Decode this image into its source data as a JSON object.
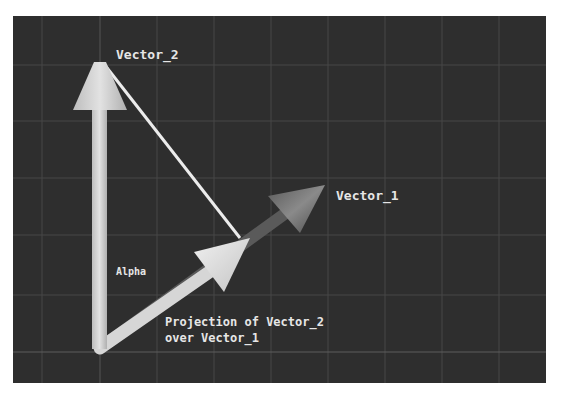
{
  "diagram": {
    "colors": {
      "background": "#2e2e2e",
      "grid": "#4a4a4a",
      "vector_2": "#cfcfcf",
      "vector_1": "#6e6e6e",
      "projection": "#d8d8d8",
      "connector": "#e8e8e8",
      "text": "#e6e6e6"
    },
    "labels": {
      "vector_2": "Vector_2",
      "vector_1": "Vector_1",
      "alpha": "Alpha",
      "projection_line1": "Projection of Vector_2",
      "projection_line2": "over Vector_1"
    },
    "nodes": [
      {
        "id": "origin",
        "x": 100,
        "y": 348
      },
      {
        "id": "vector_2_tip",
        "x": 100,
        "y": 62
      },
      {
        "id": "vector_1_tip",
        "x": 325,
        "y": 185
      },
      {
        "id": "projection_tip",
        "x": 250,
        "y": 238
      }
    ],
    "edges": [
      {
        "from": "origin",
        "to": "vector_2_tip",
        "label": "Vector_2"
      },
      {
        "from": "origin",
        "to": "vector_1_tip",
        "label": "Vector_1"
      },
      {
        "from": "origin",
        "to": "projection_tip",
        "label": "Projection of Vector_2 over Vector_1"
      },
      {
        "from": "vector_2_tip",
        "to": "projection_tip",
        "label": ""
      }
    ]
  }
}
